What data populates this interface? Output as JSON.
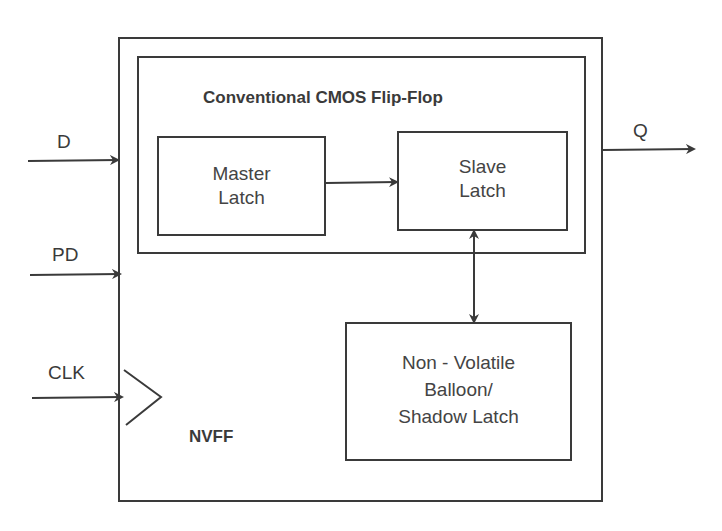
{
  "diagram": {
    "outer_block": {
      "label": "NVFF"
    },
    "inner_block": {
      "title": "Conventional CMOS Flip-Flop"
    },
    "blocks": [
      {
        "id": "master",
        "line1": "Master",
        "line2": "Latch"
      },
      {
        "id": "slave",
        "line1": "Slave",
        "line2": "Latch"
      },
      {
        "id": "nv",
        "line1": "Non - Volatile",
        "line2": "Balloon/",
        "line3": "Shadow Latch"
      }
    ],
    "inputs": [
      {
        "id": "d",
        "label": "D"
      },
      {
        "id": "pd",
        "label": "PD"
      },
      {
        "id": "clk",
        "label": "CLK"
      }
    ],
    "outputs": [
      {
        "id": "q",
        "label": "Q"
      }
    ],
    "connections": [
      {
        "from": "master",
        "to": "slave",
        "type": "unidirectional"
      },
      {
        "from": "slave",
        "to": "nv",
        "type": "bidirectional"
      }
    ],
    "colors": {
      "stroke": "#3a3a3a",
      "background": "#ffffff",
      "text": "#3a3a3a"
    }
  }
}
